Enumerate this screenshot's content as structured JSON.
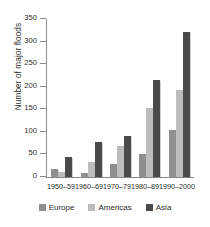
{
  "chart_data": {
    "type": "bar",
    "title": "",
    "xlabel": "",
    "ylabel": "Number of major floods",
    "categories": [
      "1950–59",
      "1960–69",
      "1970–79",
      "1980–89",
      "1990–2000"
    ],
    "series": [
      {
        "name": "Europe",
        "color": "#8f8f8f",
        "values": [
          18,
          9,
          28,
          52,
          104
        ]
      },
      {
        "name": "Americas",
        "color": "#bdbdbd",
        "values": [
          11,
          33,
          68,
          153,
          193
        ]
      },
      {
        "name": "Asia",
        "color": "#4a4a4a",
        "values": [
          45,
          78,
          90,
          216,
          321
        ]
      }
    ],
    "ylim": [
      0,
      350
    ],
    "ytick_labels": [
      "0",
      "50",
      "100",
      "150",
      "200",
      "250",
      "300",
      "350"
    ],
    "ytick_values": [
      0,
      50,
      100,
      150,
      200,
      250,
      300,
      350
    ],
    "grid": false,
    "legend_position": "bottom"
  }
}
